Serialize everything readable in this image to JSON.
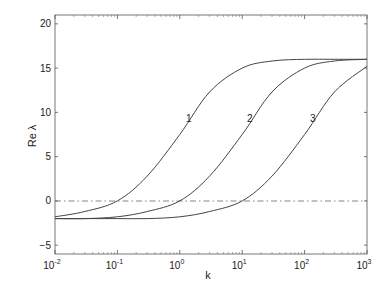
{
  "chart_data": {
    "type": "line",
    "title": "",
    "xlabel": "k",
    "ylabel": "Re λ",
    "xscale": "log",
    "xlim": [
      0.01,
      1000
    ],
    "ylim": [
      -6,
      21
    ],
    "x_ticks": [
      "10^-2",
      "10^-1",
      "10^0",
      "10^1",
      "10^2",
      "10^3"
    ],
    "y_ticks": [
      -5,
      0,
      5,
      10,
      15,
      20
    ],
    "grid": false,
    "legend": "none (curves labeled inline 1, 2, 3)",
    "reference_line": {
      "y": 0,
      "style": "dash-dot"
    },
    "x": [
      0.01,
      0.03,
      0.1,
      0.3,
      1,
      3,
      10,
      30,
      100,
      300,
      1000
    ],
    "series": [
      {
        "name": "1",
        "values": [
          -1.8,
          -1.2,
          0,
          2.8,
          7.5,
          12.3,
          15.0,
          15.8,
          16.0,
          16.0,
          16.0
        ]
      },
      {
        "name": "2",
        "values": [
          -2.0,
          -2.0,
          -1.8,
          -1.2,
          0,
          2.8,
          7.5,
          12.3,
          15.0,
          15.8,
          16.0
        ]
      },
      {
        "name": "3",
        "values": [
          -2.0,
          -2.0,
          -2.0,
          -2.0,
          -1.8,
          -1.2,
          0,
          2.8,
          7.5,
          12.3,
          15.2
        ]
      }
    ],
    "annotations": [
      {
        "text": "1",
        "x": 1,
        "y": 8.2
      },
      {
        "text": "2",
        "x": 10,
        "y": 8.2
      },
      {
        "text": "3",
        "x": 100,
        "y": 8.2
      }
    ]
  },
  "axes": {
    "xlabel": "k",
    "ylabel": "Re λ",
    "y_tick_labels": [
      "20",
      "15",
      "10",
      "5",
      "0",
      "−5"
    ],
    "x_tick_bases": [
      "10",
      "10",
      "10",
      "10",
      "10",
      "10"
    ],
    "x_tick_exponents": [
      "-2",
      "-1",
      "0",
      "1",
      "2",
      "3"
    ]
  },
  "curve_labels": [
    "1",
    "2",
    "3"
  ]
}
